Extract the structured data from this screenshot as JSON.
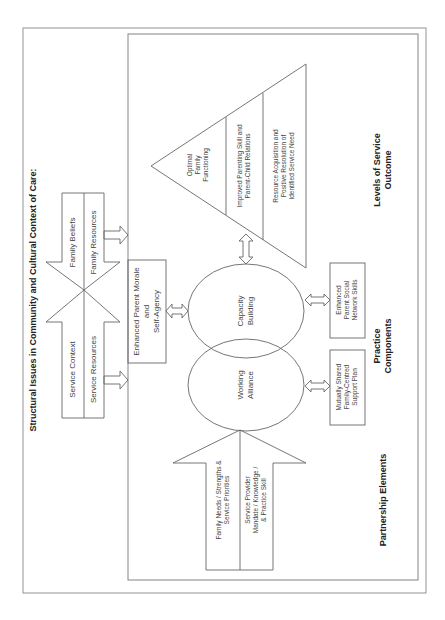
{
  "diagram": {
    "title": "Structural Issues in Community and Cultural Context of Care:",
    "context_arrows": {
      "family_beliefs": "Family Beliefs",
      "family_resources": "Family Resources",
      "service_context": "Service Context",
      "service_resources": "Service Resources"
    },
    "morale_box": [
      "Enhanced Parent Morale",
      "and",
      "Self-Agency"
    ],
    "outcome_triangle": {
      "top": [
        "Optimal",
        "Family",
        "Functioning"
      ],
      "middle": [
        "Improved Parenting Skill and",
        "Parent-Child Relations"
      ],
      "bottom": [
        "Resource Acquisition and",
        "Positive Resolution of",
        "Identified Service Need"
      ]
    },
    "ellipses": {
      "capacity": [
        "Capacity",
        "Building"
      ],
      "alliance": [
        "Working",
        "Alliance"
      ]
    },
    "input_arrow": {
      "left": [
        "Family Needs / Strengths &",
        "Service Priorities"
      ],
      "right": [
        "Service Provider",
        "Mandate / Knowledge /",
        "& Practice Skill"
      ]
    },
    "practice_boxes": {
      "social": [
        "Enhanced",
        "Parent Social",
        "Network Skills"
      ],
      "shared": [
        "Mutually Shared",
        "Family-Centred",
        "Support Plan"
      ]
    },
    "labels": {
      "levels": [
        "Levels of Service",
        "Outcome"
      ],
      "practice": [
        "Practice",
        "Components"
      ],
      "partnership": "Partnership Elements"
    },
    "colors": {
      "stroke": "#555555",
      "frame": "#777777",
      "text": "#444444",
      "background": "#ffffff"
    }
  }
}
